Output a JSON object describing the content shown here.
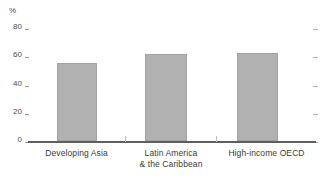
{
  "chart_data": {
    "type": "bar",
    "title": "",
    "subtitle": "",
    "xlabel": "",
    "ylabel": "%",
    "unit": "%",
    "categories": [
      "Developing Asia",
      "Latin America\n& the Caribbean",
      "High-income OECD"
    ],
    "values": [
      55,
      61,
      62
    ],
    "ylim": [
      0,
      80
    ],
    "yticks": [
      0,
      20,
      40,
      60,
      80
    ],
    "ytick_labels": [
      "0",
      "20",
      "40",
      "60",
      "80"
    ],
    "grid": false,
    "legend": null,
    "series": [
      {
        "name": "",
        "values": [
          55,
          61,
          62
        ],
        "color": "#b1b1b1"
      }
    ],
    "bar_color": "#b1b1b1",
    "axis_color": "#5e5e5e",
    "text_color": "#3a3a3a"
  },
  "axis": {
    "unit_caption": "%",
    "ticks": [
      {
        "label": "80",
        "value": 80
      },
      {
        "label": "60",
        "value": 60
      },
      {
        "label": "40",
        "value": 40
      },
      {
        "label": "20",
        "value": 20
      },
      {
        "label": "0",
        "value": 0
      }
    ]
  },
  "categories": [
    {
      "label": "Developing Asia"
    },
    {
      "label": "Latin America\n& the Caribbean"
    },
    {
      "label": "High-income OECD"
    }
  ]
}
